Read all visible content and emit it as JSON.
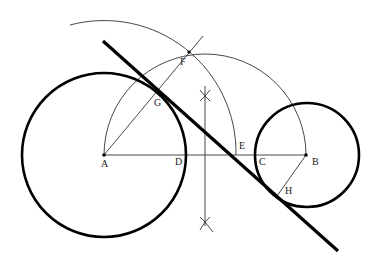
{
  "diagram": {
    "points": [
      {
        "id": "A",
        "label": "A"
      },
      {
        "id": "B",
        "label": "B"
      },
      {
        "id": "C",
        "label": "C"
      },
      {
        "id": "D",
        "label": "D"
      },
      {
        "id": "E",
        "label": "E"
      },
      {
        "id": "F",
        "label": "F"
      },
      {
        "id": "G",
        "label": "G"
      },
      {
        "id": "H",
        "label": "H"
      }
    ],
    "elements": [
      {
        "id": "circle-A",
        "type": "circle",
        "center": "A",
        "description": "large circle centered at A"
      },
      {
        "id": "circle-B",
        "type": "circle",
        "center": "B",
        "description": "small circle centered at B"
      },
      {
        "id": "arc-AE",
        "type": "arc",
        "center": "A",
        "description": "arc centered at A through F and E"
      },
      {
        "id": "semicircle-AB",
        "type": "arc",
        "description": "semicircle on AB through F"
      },
      {
        "id": "segment-AB",
        "type": "line",
        "from": "A",
        "to": "B"
      },
      {
        "id": "line-AF",
        "type": "line",
        "from": "A",
        "to": "F"
      },
      {
        "id": "segment-BH",
        "type": "line",
        "from": "B",
        "to": "H"
      },
      {
        "id": "bisector",
        "type": "line",
        "description": "perpendicular bisector of AB"
      },
      {
        "id": "tangent",
        "type": "line",
        "description": "internal common tangent through G and H"
      }
    ]
  }
}
